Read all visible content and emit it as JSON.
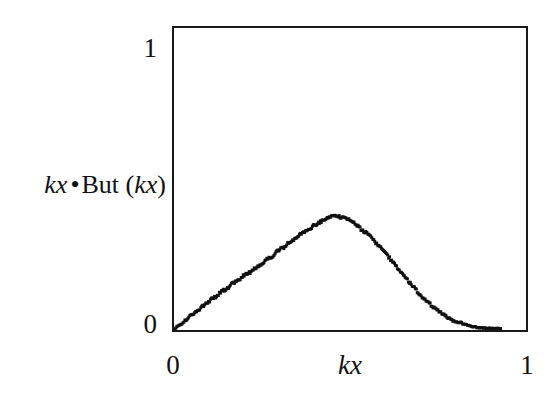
{
  "figure": {
    "background_color": "#ffffff",
    "frame_color": "#1a1a1a",
    "marker_color": "#111111"
  },
  "axes": {
    "y_tick_top": "1",
    "y_tick_bottom": "0",
    "x_tick_left": "0",
    "x_tick_right": "1",
    "x_title": "kx",
    "y_title_part1": "kx",
    "y_title_bullet": "•",
    "y_title_part2": "But (",
    "y_title_part3": "kx",
    "y_title_part4": ")"
  },
  "chart_data": {
    "type": "scatter",
    "title": "",
    "xlabel": "kx",
    "ylabel": "kx •But (kx)",
    "xlim": [
      0,
      1
    ],
    "ylim": [
      0,
      1
    ],
    "xticks": [
      0,
      1
    ],
    "yticks": [
      0,
      1
    ],
    "grid": false,
    "legend": false,
    "marker": "square-dot",
    "marker_size_px": 3,
    "peak": {
      "x": 0.4,
      "y": 0.376
    },
    "x": [
      0.0,
      0.008,
      0.017,
      0.025,
      0.034,
      0.042,
      0.051,
      0.059,
      0.067,
      0.076,
      0.084,
      0.093,
      0.101,
      0.11,
      0.118,
      0.126,
      0.135,
      0.143,
      0.152,
      0.16,
      0.169,
      0.177,
      0.185,
      0.194,
      0.202,
      0.211,
      0.219,
      0.228,
      0.236,
      0.244,
      0.253,
      0.261,
      0.27,
      0.278,
      0.287,
      0.295,
      0.303,
      0.312,
      0.32,
      0.329,
      0.337,
      0.346,
      0.354,
      0.362,
      0.371,
      0.379,
      0.388,
      0.396,
      0.405,
      0.413,
      0.421,
      0.43,
      0.438,
      0.447,
      0.455,
      0.464,
      0.472,
      0.48,
      0.489,
      0.497,
      0.506,
      0.514,
      0.523,
      0.531,
      0.539,
      0.548,
      0.556,
      0.565,
      0.573,
      0.582,
      0.59,
      0.598,
      0.607,
      0.615,
      0.624,
      0.632,
      0.64,
      0.649,
      0.657,
      0.666,
      0.674,
      0.683,
      0.691,
      0.699,
      0.708,
      0.716,
      0.725,
      0.733,
      0.742,
      0.75,
      0.758,
      0.767,
      0.775,
      0.784,
      0.792,
      0.801,
      0.809,
      0.817,
      0.826,
      0.834,
      0.843,
      0.851,
      0.86,
      0.868,
      0.876,
      0.885,
      0.893,
      0.902,
      0.91,
      0.919,
      0.927
    ],
    "y": [
      0.0,
      0.01,
      0.018,
      0.026,
      0.033,
      0.042,
      0.049,
      0.058,
      0.064,
      0.073,
      0.082,
      0.088,
      0.097,
      0.104,
      0.11,
      0.119,
      0.128,
      0.133,
      0.138,
      0.148,
      0.156,
      0.16,
      0.166,
      0.176,
      0.184,
      0.188,
      0.193,
      0.203,
      0.211,
      0.215,
      0.222,
      0.232,
      0.239,
      0.243,
      0.252,
      0.262,
      0.268,
      0.273,
      0.283,
      0.292,
      0.297,
      0.302,
      0.311,
      0.32,
      0.325,
      0.33,
      0.338,
      0.345,
      0.35,
      0.356,
      0.361,
      0.366,
      0.371,
      0.374,
      0.376,
      0.376,
      0.375,
      0.374,
      0.371,
      0.366,
      0.36,
      0.352,
      0.343,
      0.334,
      0.326,
      0.32,
      0.312,
      0.302,
      0.29,
      0.279,
      0.268,
      0.257,
      0.246,
      0.234,
      0.222,
      0.21,
      0.198,
      0.186,
      0.174,
      0.162,
      0.15,
      0.139,
      0.128,
      0.117,
      0.107,
      0.097,
      0.088,
      0.079,
      0.071,
      0.063,
      0.056,
      0.049,
      0.043,
      0.038,
      0.033,
      0.028,
      0.024,
      0.021,
      0.018,
      0.016,
      0.013,
      0.011,
      0.009,
      0.008,
      0.007,
      0.006,
      0.006,
      0.005,
      0.005,
      0.005,
      0.004
    ]
  }
}
